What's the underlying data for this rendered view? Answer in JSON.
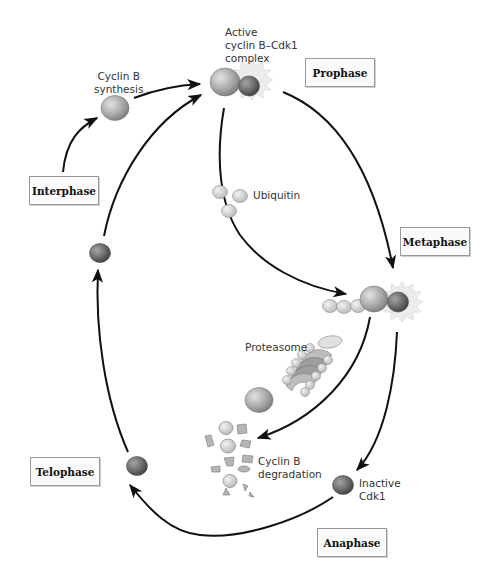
{
  "diagram": {
    "phases": {
      "interphase": "Interphase",
      "prophase": "Prophase",
      "metaphase": "Metaphase",
      "anaphase": "Anaphase",
      "telophase": "Telophase"
    },
    "labels": {
      "cyclin_synthesis": "Cyclin B\nsynthesis",
      "active_complex": "Active\ncyclin B–Cdk1\ncomplex",
      "ubiquitin": "Ubiquitin",
      "proteasome": "Proteasome",
      "cyclin_degradation": "Cyclin B\ndegradation",
      "inactive_cdk1": "Inactive\nCdk1"
    },
    "colors": {
      "cyclin": "#a8a8a8",
      "cdk1": "#6e6e6e",
      "ubiquitin": "#d6d6d6",
      "arrow": "#111111",
      "glow": "#ececec",
      "box_border": "#9a9a9a"
    }
  }
}
